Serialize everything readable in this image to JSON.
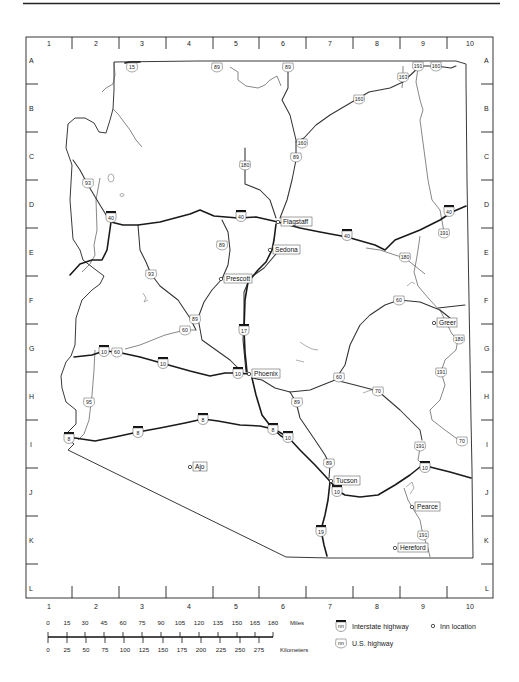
{
  "map": {
    "columns": [
      "1",
      "2",
      "3",
      "4",
      "5",
      "6",
      "7",
      "8",
      "9",
      "10"
    ],
    "rows": [
      "A",
      "B",
      "C",
      "D",
      "E",
      "F",
      "G",
      "H",
      "I",
      "J",
      "K",
      "L"
    ],
    "cities": [
      {
        "name": "Flagstaff",
        "x": 277,
        "y": 222
      },
      {
        "name": "Sedona",
        "x": 270,
        "y": 250
      },
      {
        "name": "Prescott",
        "x": 221,
        "y": 279
      },
      {
        "name": "Phoenix",
        "x": 249,
        "y": 374
      },
      {
        "name": "Greer",
        "x": 434,
        "y": 323
      },
      {
        "name": "Ajo",
        "x": 190,
        "y": 467
      },
      {
        "name": "Tucson",
        "x": 331,
        "y": 481
      },
      {
        "name": "Pearce",
        "x": 411,
        "y": 507
      },
      {
        "name": "Hereford",
        "x": 394,
        "y": 548
      }
    ],
    "interstate_shields": [
      {
        "num": "40",
        "x": 111,
        "y": 217
      },
      {
        "num": "40",
        "x": 241,
        "y": 216
      },
      {
        "num": "40",
        "x": 347,
        "y": 235
      },
      {
        "num": "40",
        "x": 449,
        "y": 211
      },
      {
        "num": "10",
        "x": 104,
        "y": 351
      },
      {
        "num": "10",
        "x": 163,
        "y": 363
      },
      {
        "name": "",
        "num": "10",
        "x": 238,
        "y": 373
      },
      {
        "num": "10",
        "x": 288,
        "y": 437
      },
      {
        "num": "10",
        "x": 336,
        "y": 491
      },
      {
        "num": "10",
        "x": 425,
        "y": 467
      },
      {
        "num": "8",
        "x": 69,
        "y": 438
      },
      {
        "num": "8",
        "x": 138,
        "y": 432
      },
      {
        "num": "8",
        "x": 203,
        "y": 419
      },
      {
        "num": "8",
        "x": 273,
        "y": 429
      },
      {
        "num": "17",
        "x": 244,
        "y": 330
      },
      {
        "num": "19",
        "x": 321,
        "y": 531
      }
    ],
    "us_shields": [
      {
        "num": "15",
        "x": 132,
        "y": 67
      },
      {
        "num": "89",
        "x": 217,
        "y": 67
      },
      {
        "num": "89",
        "x": 288,
        "y": 67
      },
      {
        "num": "191",
        "x": 418,
        "y": 66
      },
      {
        "num": "160",
        "x": 436,
        "y": 66
      },
      {
        "num": "163",
        "x": 403,
        "y": 77
      },
      {
        "num": "160",
        "x": 359,
        "y": 99
      },
      {
        "num": "160",
        "x": 302,
        "y": 143
      },
      {
        "num": "89",
        "x": 296,
        "y": 157
      },
      {
        "num": "180",
        "x": 245,
        "y": 165
      },
      {
        "num": "93",
        "x": 88,
        "y": 183
      },
      {
        "num": "191",
        "x": 444,
        "y": 233
      },
      {
        "num": "89",
        "x": 222,
        "y": 245
      },
      {
        "num": "180",
        "x": 405,
        "y": 257
      },
      {
        "num": "93",
        "x": 151,
        "y": 274
      },
      {
        "num": "89",
        "x": 195,
        "y": 319
      },
      {
        "name": "",
        "num": "60",
        "x": 185,
        "y": 330
      },
      {
        "num": "60",
        "x": 399,
        "y": 300
      },
      {
        "num": "60",
        "x": 117,
        "y": 352
      },
      {
        "num": "180",
        "x": 459,
        "y": 339
      },
      {
        "num": "95",
        "x": 89,
        "y": 402
      },
      {
        "num": "60",
        "x": 339,
        "y": 377
      },
      {
        "num": "70",
        "x": 378,
        "y": 391
      },
      {
        "num": "89",
        "x": 297,
        "y": 402
      },
      {
        "num": "191",
        "x": 441,
        "y": 372
      },
      {
        "num": "191",
        "x": 420,
        "y": 446
      },
      {
        "num": "70",
        "x": 462,
        "y": 441
      },
      {
        "num": "89",
        "x": 329,
        "y": 463
      },
      {
        "num": "191",
        "x": 423,
        "y": 535
      }
    ]
  },
  "scale": {
    "miles_label": "Miles",
    "km_label": "Kilometers",
    "miles": [
      "0",
      "15",
      "30",
      "45",
      "60",
      "75",
      "90",
      "105",
      "120",
      "135",
      "150",
      "165",
      "180"
    ],
    "kilometers": [
      "0",
      "25",
      "50",
      "75",
      "100",
      "125",
      "150",
      "175",
      "200",
      "225",
      "250",
      "275"
    ]
  },
  "legend": {
    "interstate_label": "Interstate highway",
    "us_label": "U.S. highway",
    "inn_label": "Inn location",
    "shield_placeholder": "nn"
  },
  "colors": {
    "ink": "#1a1a1a",
    "background": "#ffffff",
    "label_box": "#ffffff"
  }
}
